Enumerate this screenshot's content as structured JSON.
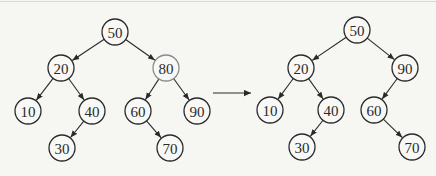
{
  "diagram": {
    "type": "binary-search-tree-deletion",
    "colors": {
      "stroke": "#2a2a2a",
      "deleted_stroke": "#8a8a8a",
      "background": "#f6f6f3"
    },
    "before": {
      "nodes": [
        {
          "id": "b50",
          "label": "50",
          "x": 115,
          "y": 32
        },
        {
          "id": "b20",
          "label": "20",
          "x": 61,
          "y": 68
        },
        {
          "id": "b80",
          "label": "80",
          "x": 166,
          "y": 68,
          "state": "deleted"
        },
        {
          "id": "b10",
          "label": "10",
          "x": 28,
          "y": 111
        },
        {
          "id": "b40",
          "label": "40",
          "x": 92,
          "y": 111
        },
        {
          "id": "b60",
          "label": "60",
          "x": 138,
          "y": 111
        },
        {
          "id": "b90",
          "label": "90",
          "x": 197,
          "y": 111
        },
        {
          "id": "b30",
          "label": "30",
          "x": 62,
          "y": 148
        },
        {
          "id": "b70",
          "label": "70",
          "x": 170,
          "y": 148
        }
      ],
      "edges": [
        [
          "b50",
          "b20"
        ],
        [
          "b50",
          "b80"
        ],
        [
          "b20",
          "b10"
        ],
        [
          "b20",
          "b40"
        ],
        [
          "b40",
          "b30"
        ],
        [
          "b80",
          "b60"
        ],
        [
          "b80",
          "b90"
        ],
        [
          "b60",
          "b70"
        ]
      ]
    },
    "transition_arrow": {
      "x1": 213,
      "y1": 93,
      "x2": 251,
      "y2": 93
    },
    "after": {
      "nodes": [
        {
          "id": "a50",
          "label": "50",
          "x": 357,
          "y": 30
        },
        {
          "id": "a20",
          "label": "20",
          "x": 301,
          "y": 68
        },
        {
          "id": "a90",
          "label": "90",
          "x": 405,
          "y": 68
        },
        {
          "id": "a10",
          "label": "10",
          "x": 270,
          "y": 110
        },
        {
          "id": "a40",
          "label": "40",
          "x": 331,
          "y": 110
        },
        {
          "id": "a60",
          "label": "60",
          "x": 374,
          "y": 110
        },
        {
          "id": "a30",
          "label": "30",
          "x": 302,
          "y": 147
        },
        {
          "id": "a70",
          "label": "70",
          "x": 412,
          "y": 147
        }
      ],
      "edges": [
        [
          "a50",
          "a20"
        ],
        [
          "a50",
          "a90"
        ],
        [
          "a20",
          "a10"
        ],
        [
          "a20",
          "a40"
        ],
        [
          "a40",
          "a30"
        ],
        [
          "a90",
          "a60"
        ],
        [
          "a60",
          "a70"
        ]
      ]
    },
    "node_radius": 13
  }
}
